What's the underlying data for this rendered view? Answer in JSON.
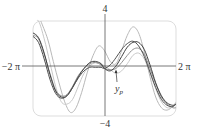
{
  "chart_data": {
    "type": "line",
    "title": "",
    "xlabel": "",
    "ylabel": "",
    "xlim": [
      -6.2832,
      6.2832
    ],
    "ylim": [
      -4,
      4
    ],
    "x_tick_labels": {
      "min": "−2 π",
      "max": "2 π"
    },
    "y_tick_labels": {
      "max": "4",
      "min": "−4"
    },
    "grid": false,
    "annotation": {
      "label": "y",
      "subscript": "p",
      "target": "particular solution"
    },
    "series": [
      {
        "name": "light-1",
        "color": "#b8b8b8",
        "x": [
          -5.6,
          -5.0,
          -4.5,
          -4.0,
          -3.5,
          -3.0,
          -2.5,
          -2.0,
          -1.5,
          -1.0,
          -0.5,
          0.0,
          0.5,
          1.0,
          1.5,
          2.0,
          2.5,
          3.0,
          3.5,
          4.0,
          4.5,
          5.0,
          5.5,
          6.0,
          6.28
        ],
        "y": [
          4.0,
          2.5,
          0.6,
          -1.2,
          -2.8,
          -3.7,
          -3.3,
          -2.0,
          -0.3,
          1.1,
          1.9,
          1.5,
          0.6,
          0.4,
          1.5,
          2.8,
          3.5,
          3.0,
          1.4,
          -0.7,
          -2.4,
          -3.3,
          -3.5,
          -3.2,
          -2.9
        ]
      },
      {
        "name": "light-2",
        "color": "#c8c8c8",
        "x": [
          -6.28,
          -5.8,
          -5.3,
          -4.8,
          -4.3,
          -3.8,
          -3.3,
          -2.8,
          -2.3,
          -1.8,
          -1.3,
          -0.8,
          -0.3,
          0.0,
          0.5,
          1.0,
          1.5,
          2.0,
          2.5,
          3.0,
          3.5,
          4.0,
          4.5,
          5.0,
          5.5,
          6.0,
          6.28
        ],
        "y": [
          4.0,
          4.0,
          2.5,
          0.5,
          -1.5,
          -2.8,
          -3.0,
          -2.6,
          -1.5,
          -0.4,
          0.2,
          0.5,
          0.4,
          0.2,
          -0.1,
          -0.4,
          -0.2,
          0.4,
          1.1,
          1.3,
          0.8,
          -0.4,
          -1.7,
          -2.8,
          -3.3,
          -3.2,
          -2.8
        ]
      },
      {
        "name": "medium",
        "color": "#909090",
        "x": [
          -6.28,
          -5.8,
          -5.3,
          -4.8,
          -4.3,
          -3.8,
          -3.3,
          -2.8,
          -2.3,
          -1.8,
          -1.3,
          -0.8,
          -0.3,
          0.0,
          0.5,
          1.0,
          1.5,
          2.0,
          2.5,
          3.0,
          3.5,
          4.0,
          4.5,
          5.0,
          5.5,
          6.0,
          6.28
        ],
        "y": [
          2.8,
          2.5,
          1.2,
          -0.4,
          -1.8,
          -2.3,
          -2.2,
          -1.5,
          -0.6,
          0.0,
          0.4,
          0.5,
          0.3,
          0.0,
          -0.1,
          0.0,
          0.5,
          1.1,
          1.6,
          1.7,
          1.2,
          0.0,
          -1.3,
          -2.4,
          -3.0,
          -3.3,
          -3.3
        ]
      },
      {
        "name": "dark-1",
        "color": "#404040",
        "x": [
          -6.28,
          -5.8,
          -5.3,
          -4.8,
          -4.3,
          -3.8,
          -3.3,
          -2.8,
          -2.3,
          -1.8,
          -1.3,
          -0.8,
          -0.3,
          0.0,
          0.5,
          1.0,
          1.5,
          2.0,
          2.5,
          3.0,
          3.5,
          4.0,
          4.5,
          5.0,
          5.5,
          6.0,
          6.28
        ],
        "y": [
          3.0,
          2.6,
          1.3,
          -0.5,
          -1.9,
          -2.4,
          -2.3,
          -1.6,
          -0.7,
          0.0,
          0.5,
          0.6,
          0.4,
          0.0,
          -0.2,
          0.2,
          1.0,
          1.8,
          2.2,
          2.2,
          1.6,
          0.3,
          -1.2,
          -2.3,
          -2.9,
          -3.1,
          -3.0
        ]
      },
      {
        "name": "dark-2",
        "color": "#505050",
        "x": [
          -6.28,
          -5.8,
          -5.3,
          -4.8,
          -4.3,
          -3.8,
          -3.3,
          -2.8,
          -2.3,
          -1.8,
          -1.3,
          -0.8,
          -0.3,
          0.0,
          0.5,
          1.0,
          1.5,
          2.0,
          2.5,
          3.0,
          3.5,
          4.0,
          4.5,
          5.0,
          5.5,
          6.0,
          6.28
        ],
        "y": [
          2.7,
          2.2,
          0.8,
          -0.9,
          -2.1,
          -2.5,
          -2.3,
          -1.6,
          -0.8,
          -0.2,
          0.1,
          0.1,
          0.1,
          0.0,
          0.3,
          0.9,
          1.6,
          2.1,
          2.3,
          1.9,
          1.0,
          -0.3,
          -1.6,
          -2.6,
          -3.1,
          -3.2,
          -3.0
        ]
      }
    ]
  }
}
